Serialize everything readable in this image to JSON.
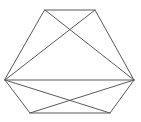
{
  "figure": {
    "shape_type": "line-drawing",
    "canvas": {
      "width": 141,
      "height": 122,
      "background_color": "#ffffff"
    },
    "stroke": {
      "color": "#5a5a5a",
      "width": 1
    },
    "hexagon": {
      "name": "outer-hexagon",
      "vertex_labels": [
        "top-left",
        "top-right",
        "right",
        "bottom-right",
        "bottom-left",
        "left"
      ],
      "vertices": [
        {
          "label": "top-left",
          "x": 45,
          "y": 10
        },
        {
          "label": "top-right",
          "x": 95,
          "y": 10
        },
        {
          "label": "right",
          "x": 134,
          "y": 80
        },
        {
          "label": "bottom-right",
          "x": 110,
          "y": 113
        },
        {
          "label": "bottom-left",
          "x": 30,
          "y": 113
        },
        {
          "label": "left",
          "x": 5,
          "y": 80
        }
      ],
      "path": "M45,10 L95,10 L134,80 L110,113 L30,113 L5,80 Z"
    },
    "chords": [
      {
        "name": "chord-topleft-to-right",
        "from": "top-left",
        "to": "right",
        "path": "M45,10 L134,80"
      },
      {
        "name": "chord-topright-to-left",
        "from": "top-right",
        "to": "left",
        "path": "M95,10 L5,80"
      },
      {
        "name": "chord-left-to-right-midline",
        "from": "left",
        "to": "right",
        "path": "M5,80 L134,80"
      },
      {
        "name": "chord-left-to-bottomright",
        "from": "left",
        "to": "bottom-right",
        "path": "M5,80 L110,113"
      },
      {
        "name": "chord-right-to-bottomleft",
        "from": "right",
        "to": "bottom-left",
        "path": "M134,80 L30,113"
      }
    ],
    "intersections": [
      {
        "name": "upper-x-crossing",
        "x": 70,
        "y": 52
      },
      {
        "name": "midline-left-crossing",
        "x": 46,
        "y": 80
      },
      {
        "name": "midline-right-crossing",
        "x": 92,
        "y": 80
      }
    ]
  }
}
